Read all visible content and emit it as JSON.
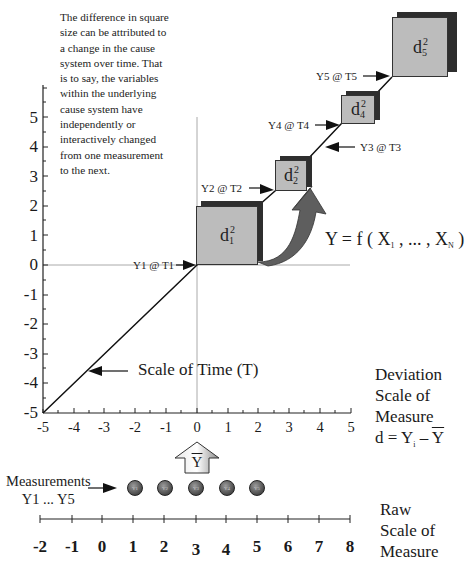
{
  "annotation": {
    "text": "The difference in square size can be attributed to a change in the cause system over time. That is to say, the variables within the underlying cause system have independently or interactively changed from one measurement to the next."
  },
  "deviation_axes": {
    "y_ticks": [
      "5",
      "4",
      "3",
      "2",
      "1",
      "0",
      "-1",
      "-2",
      "-3",
      "-4",
      "-5"
    ],
    "x_ticks": [
      "-5",
      "-4",
      "-3",
      "-2",
      "-1",
      "0",
      "1",
      "2",
      "3",
      "4",
      "5"
    ],
    "time_scale_label": "Scale of Time (T)"
  },
  "points": [
    {
      "label": "Y1 @ T1",
      "square": "d",
      "sub": "1",
      "sup": "2"
    },
    {
      "label": "Y2 @ T2",
      "square": "d",
      "sub": "2",
      "sup": "2"
    },
    {
      "label": "Y3 @  T3",
      "square": "",
      "sub": "",
      "sup": ""
    },
    {
      "label": "Y4 @ T4",
      "square": "d",
      "sub": "4",
      "sup": "2"
    },
    {
      "label": "Y5 @ T5",
      "square": "d",
      "sub": "5",
      "sup": "2"
    }
  ],
  "formula": {
    "y": "Y = f (",
    "x1": "X",
    "x1_sub": "1",
    "mid": ", ... ,",
    "xn": "X",
    "xn_sub": "N",
    "close": ")"
  },
  "deviation_label": {
    "line1": "Deviation",
    "line2": "Scale of",
    "line3": "Measure",
    "eq_left": "d = Y",
    "eq_sub": "i",
    "eq_mid": " – ",
    "eq_right": "Y"
  },
  "mean_arrow": {
    "label": "Y"
  },
  "measurements": {
    "line1": "Measurements",
    "line2": "Y1 ... Y5",
    "circles": [
      "Y1",
      "Y2",
      "Y3",
      "Y4",
      "Y5"
    ]
  },
  "raw_scale": {
    "ticks": [
      "-2",
      "-1",
      "0",
      "1",
      "2",
      "3",
      "4",
      "5",
      "6",
      "7",
      "8"
    ],
    "line1": "Raw",
    "line2": "Scale of",
    "line3": "Measure"
  }
}
